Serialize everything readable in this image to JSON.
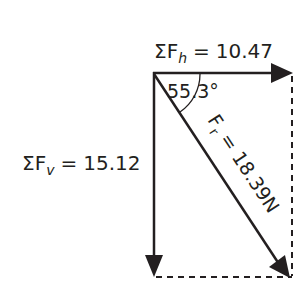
{
  "diagram": {
    "type": "force-vector-resolution",
    "horizontal_sum": {
      "symbol": "ΣF",
      "subscript": "h",
      "equals": "=",
      "value": "10.47"
    },
    "vertical_sum": {
      "symbol": "ΣF",
      "subscript": "v",
      "equals": "=",
      "value": "15.12"
    },
    "resultant": {
      "symbol": "F",
      "subscript": "r",
      "equals": "=",
      "value": "18.39N"
    },
    "angle": {
      "label": "55.3°"
    },
    "colors": {
      "ink": "#231f20",
      "background": "#ffffff"
    }
  }
}
